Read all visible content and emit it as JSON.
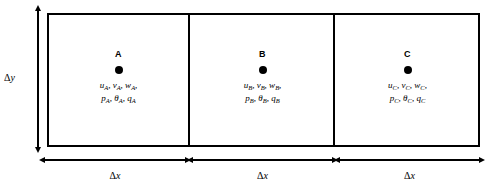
{
  "figure": {
    "background_color": "#ffffff",
    "line_color": "#000000"
  },
  "vertical_dimension": {
    "symbol_delta": "Δ",
    "symbol_var": "y",
    "label": "Δy",
    "arrow": "double-headed-vertical"
  },
  "horizontal_dimensions": [
    {
      "label": "Δx",
      "symbol_delta": "Δ",
      "symbol_var": "x",
      "arrow": "double-headed-horizontal"
    },
    {
      "label": "Δx",
      "symbol_delta": "Δ",
      "symbol_var": "x",
      "arrow": "double-headed-horizontal"
    },
    {
      "label": "Δx",
      "symbol_delta": "Δ",
      "symbol_var": "x",
      "arrow": "double-headed-horizontal"
    }
  ],
  "cells": [
    {
      "letter": "A",
      "marker": "filled-circle",
      "line1": [
        {
          "var": "u",
          "sub": "A"
        },
        {
          "var": "v",
          "sub": "A"
        },
        {
          "var": "w",
          "sub": "A"
        }
      ],
      "line2": [
        {
          "var": "p",
          "sub": "A"
        },
        {
          "var": "θ",
          "sub": "A"
        },
        {
          "var": "q",
          "sub": "A"
        }
      ],
      "line1_text": "uᴀ, vᴀ, wᴀ,",
      "line2_text": "pᴀ, θᴀ, qᴀ"
    },
    {
      "letter": "B",
      "marker": "filled-circle",
      "line1": [
        {
          "var": "u",
          "sub": "B"
        },
        {
          "var": "v",
          "sub": "B"
        },
        {
          "var": "w",
          "sub": "B"
        }
      ],
      "line2": [
        {
          "var": "p",
          "sub": "B"
        },
        {
          "var": "θ",
          "sub": "B"
        },
        {
          "var": "q",
          "sub": "B"
        }
      ],
      "line1_text": "uʙ, vʙ, wʙ,",
      "line2_text": "pʙ, θʙ, qʙ"
    },
    {
      "letter": "C",
      "marker": "filled-circle",
      "line1": [
        {
          "var": "u",
          "sub": "C"
        },
        {
          "var": "v",
          "sub": "C"
        },
        {
          "var": "w",
          "sub": "C"
        }
      ],
      "line2": [
        {
          "var": "p",
          "sub": "C"
        },
        {
          "var": "θ",
          "sub": "C"
        },
        {
          "var": "q",
          "sub": "C"
        }
      ],
      "line1_text": "uᴄ, vᴄ, wᴄ,",
      "line2_text": "pᴄ, θᴄ, qᴄ"
    }
  ]
}
